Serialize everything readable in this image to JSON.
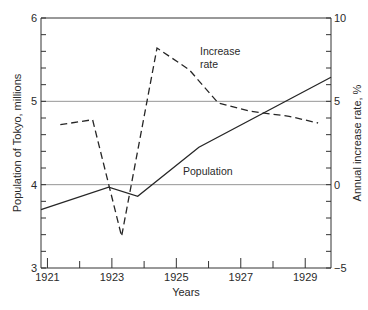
{
  "chart_data": {
    "type": "line",
    "title": "",
    "xlabel": "Years",
    "ylabel": "Population of Tokyo, millions",
    "y2label": "Annual increase rate, %",
    "xlim": [
      1920.8,
      1929.8
    ],
    "ylim": [
      3,
      6
    ],
    "y2lim": [
      -5,
      10
    ],
    "x_ticks": [
      1921,
      1922,
      1923,
      1924,
      1925,
      1926,
      1927,
      1928,
      1929
    ],
    "x_tick_labels": [
      "1921",
      "1923",
      "1925",
      "1927",
      "1929"
    ],
    "y_ticks": [
      3,
      4,
      5,
      6
    ],
    "y_tick_labels": [
      "3",
      "4",
      "5",
      "6"
    ],
    "y_minor_step": 0.2,
    "y2_ticks": [
      -5,
      0,
      5,
      10
    ],
    "y2_tick_labels": [
      "−5",
      "0",
      "5",
      "10"
    ],
    "y2_minor_step": 1,
    "grid": {
      "horizontal_at_left_axis": [
        4,
        5
      ]
    },
    "series": [
      {
        "name": "Population",
        "axis": "left",
        "style": "solid",
        "x": [
          1920.8,
          1922.9,
          1923.8,
          1925.7,
          1929.8
        ],
        "y": [
          3.7,
          3.97,
          3.86,
          4.45,
          5.29
        ]
      },
      {
        "name": "Increase rate",
        "axis": "right",
        "style": "dashed",
        "x": [
          1921.4,
          1922.4,
          1923.3,
          1924.4,
          1925.4,
          1926.3,
          1927.3,
          1928.5,
          1929.4
        ],
        "y": [
          3.6,
          3.9,
          -3.1,
          8.2,
          6.9,
          4.9,
          4.4,
          4.1,
          3.7
        ]
      }
    ],
    "annotations": [
      {
        "text_lines": [
          "Increase",
          "rate"
        ],
        "series": "Increase rate"
      },
      {
        "text_lines": [
          "Population"
        ],
        "series": "Population"
      }
    ]
  }
}
